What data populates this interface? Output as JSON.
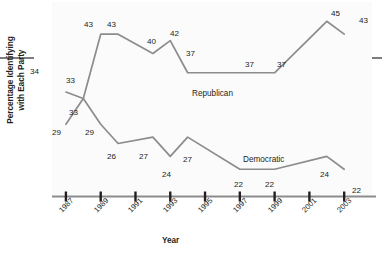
{
  "chart_data": {
    "type": "line",
    "title": "",
    "xlabel": "Year",
    "ylabel_line1": "Percentage Identifying",
    "ylabel_line2": "with Each Party",
    "x_tick_labels": [
      "1987",
      "1989",
      "1991",
      "1993",
      "1995",
      "1997",
      "1999",
      "2001",
      "2003"
    ],
    "x_tick_values": [
      1987,
      1989,
      1991,
      1993,
      1995,
      1997,
      1999,
      2001,
      2003
    ],
    "xlim": [
      1986.2,
      2004.6
    ],
    "ylim": [
      18,
      48
    ],
    "grid": false,
    "legend_position": "inline-annotation",
    "line_color": "#8c8c8c",
    "axis_color": "#8c8c8c",
    "text_color": "#231f20",
    "series": [
      {
        "name": "Republican",
        "label": "Republican",
        "label_x": 192,
        "label_y": 89,
        "x": [
          1987,
          1988,
          1989,
          1990,
          1992,
          1993,
          1994,
          1997,
          1999,
          2002,
          2003
        ],
        "values": [
          34,
          33,
          43,
          43,
          40,
          42,
          37,
          37,
          37,
          45,
          43
        ],
        "point_labels": [
          "34",
          "33",
          "43",
          "43",
          "40",
          "42",
          "37",
          "37",
          "37",
          "45",
          "43"
        ]
      },
      {
        "name": "Democratic",
        "label": "Democratic",
        "label_x": 243,
        "label_y": 155,
        "x": [
          1987,
          1988,
          1989,
          1990,
          1992,
          1993,
          1994,
          1997,
          1999,
          2002,
          2003
        ],
        "values": [
          29,
          33,
          29,
          26,
          27,
          24,
          27,
          22,
          22,
          24,
          22
        ],
        "point_labels": [
          "29",
          "33",
          "29",
          "26",
          "27",
          "24",
          "27",
          "22",
          "22",
          "24",
          "22"
        ]
      }
    ],
    "data_labels": [
      {
        "id": "rep-1987",
        "text": "34",
        "x": 30,
        "y": 67,
        "series": "Republican"
      },
      {
        "id": "rep-1988",
        "text": "33",
        "x": 66,
        "y": 76,
        "series": "Republican"
      },
      {
        "id": "rep-1989",
        "text": "43",
        "x": 84,
        "y": 20,
        "series": "Republican"
      },
      {
        "id": "rep-1990",
        "text": "43",
        "x": 107,
        "y": 20,
        "series": "Republican"
      },
      {
        "id": "rep-1992",
        "text": "40",
        "x": 147,
        "y": 37,
        "series": "Republican"
      },
      {
        "id": "rep-1993",
        "text": "42",
        "x": 170,
        "y": 29,
        "series": "Republican"
      },
      {
        "id": "rep-1994",
        "text": "37",
        "x": 186,
        "y": 49,
        "series": "Republican"
      },
      {
        "id": "rep-1997",
        "text": "37",
        "x": 245,
        "y": 60,
        "series": "Republican"
      },
      {
        "id": "rep-1999",
        "text": "37",
        "x": 277,
        "y": 60,
        "series": "Republican"
      },
      {
        "id": "rep-2002",
        "text": "45",
        "x": 331,
        "y": 9,
        "series": "Republican"
      },
      {
        "id": "rep-2003",
        "text": "43",
        "x": 359,
        "y": 16,
        "series": "Republican"
      },
      {
        "id": "dem-1987",
        "text": "29",
        "x": 52,
        "y": 128,
        "series": "Democratic"
      },
      {
        "id": "dem-1988",
        "text": "33",
        "x": 69,
        "y": 108,
        "series": "Democratic"
      },
      {
        "id": "dem-1989",
        "text": "29",
        "x": 85,
        "y": 128,
        "series": "Democratic"
      },
      {
        "id": "dem-1990",
        "text": "26",
        "x": 107,
        "y": 152,
        "series": "Democratic"
      },
      {
        "id": "dem-1992",
        "text": "27",
        "x": 139,
        "y": 152,
        "series": "Democratic"
      },
      {
        "id": "dem-1993",
        "text": "24",
        "x": 162,
        "y": 170,
        "series": "Democratic"
      },
      {
        "id": "dem-1994",
        "text": "27",
        "x": 183,
        "y": 155,
        "series": "Democratic"
      },
      {
        "id": "dem-1997",
        "text": "22",
        "x": 234,
        "y": 180,
        "series": "Democratic"
      },
      {
        "id": "dem-1999",
        "text": "22",
        "x": 265,
        "y": 180,
        "series": "Democratic"
      },
      {
        "id": "dem-2002",
        "text": "24",
        "x": 320,
        "y": 170,
        "series": "Democratic"
      },
      {
        "id": "dem-2003",
        "text": "22",
        "x": 352,
        "y": 186,
        "series": "Democratic"
      }
    ]
  }
}
